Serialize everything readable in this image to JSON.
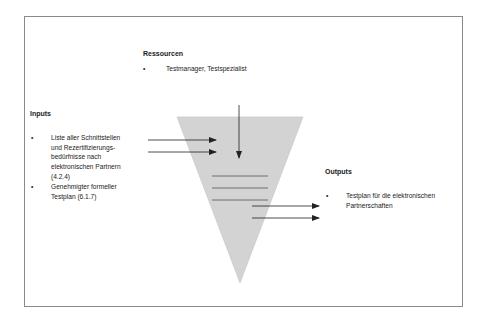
{
  "resources": {
    "heading": "Ressourcen",
    "items": [
      "Testmanager, Testspezialist"
    ]
  },
  "inputs": {
    "heading": "Inputs",
    "items": [
      {
        "lines": [
          "Liste aller Schnittstellen",
          "und Rezertifizierungs-",
          "bedürfnisse nach",
          "elektronischen Partnern",
          "(4.2.4)"
        ]
      },
      {
        "lines": [
          "Genehmigter formeller",
          "Testplan (6.1.7)"
        ]
      }
    ]
  },
  "outputs": {
    "heading": "Outputs",
    "items": [
      {
        "lines": [
          "Testplan für die elektronischen",
          "Partnerschaften"
        ]
      }
    ]
  },
  "bullet_char": "•",
  "colors": {
    "funnel_fill": "#d3d3d3",
    "frame_border": "#8a8a8a",
    "arrow": "#222222",
    "process_lines": "#555555"
  }
}
